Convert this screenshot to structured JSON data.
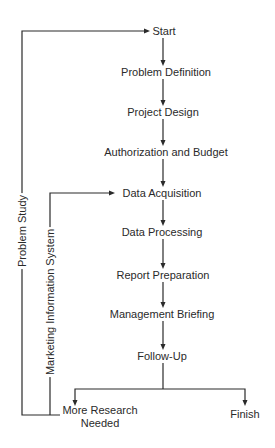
{
  "diagram": {
    "type": "flowchart",
    "nodes": {
      "start": "Start",
      "problem_definition": "Problem Definition",
      "project_design": "Project Design",
      "authorization_budget": "Authorization and Budget",
      "data_acquisition": "Data Acquisition",
      "data_processing": "Data Processing",
      "report_preparation": "Report Preparation",
      "management_briefing": "Management Briefing",
      "follow_up": "Follow-Up",
      "more_research_line1": "More Research",
      "more_research_line2": "Needed",
      "finish": "Finish"
    },
    "loops": {
      "problem_study": "Problem Study",
      "marketing_information_system": "Marketing Information System"
    },
    "edges": [
      [
        "Start",
        "Problem Definition"
      ],
      [
        "Problem Definition",
        "Project Design"
      ],
      [
        "Project Design",
        "Authorization and Budget"
      ],
      [
        "Authorization and Budget",
        "Data Acquisition"
      ],
      [
        "Data Acquisition",
        "Data Processing"
      ],
      [
        "Data Processing",
        "Report Preparation"
      ],
      [
        "Report Preparation",
        "Management Briefing"
      ],
      [
        "Management Briefing",
        "Follow-Up"
      ],
      [
        "Follow-Up",
        "More Research Needed"
      ],
      [
        "Follow-Up",
        "Finish"
      ],
      [
        "More Research Needed",
        "Start",
        "Problem Study"
      ],
      [
        "More Research Needed",
        "Data Acquisition",
        "Marketing Information System"
      ]
    ],
    "colors": {
      "line": "#2a2a2a",
      "text": "#2a2a2a",
      "background": "#ffffff"
    }
  }
}
